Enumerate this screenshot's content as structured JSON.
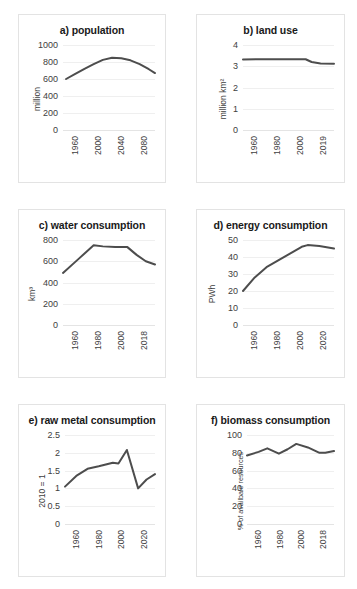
{
  "figure": {
    "background": "#ffffff",
    "line_color": "#4d4d4d",
    "grid_color": "#efefef",
    "panel_border_color": "#e3e3e3"
  },
  "chart_data": [
    {
      "type": "line",
      "title": "a) population",
      "xlabel": "",
      "ylabel": "million",
      "ylim": [
        0,
        1000
      ],
      "yticks": [
        "0",
        "200",
        "400",
        "600",
        "800",
        "1000"
      ],
      "xticks": [
        "1960",
        "2000",
        "2040",
        "2080"
      ],
      "xlim": [
        1950,
        2100
      ],
      "grid": true,
      "legend": "none",
      "x": [
        1955,
        1970,
        1985,
        2000,
        2015,
        2030,
        2045,
        2060,
        2075,
        2090,
        2100
      ],
      "values": [
        600,
        660,
        720,
        775,
        825,
        850,
        845,
        820,
        775,
        715,
        670
      ]
    },
    {
      "type": "line",
      "title": "b) land use",
      "xlabel": "",
      "ylabel": "million km²",
      "ylim": [
        0,
        4
      ],
      "yticks": [
        "0",
        "1",
        "2",
        "3",
        "4"
      ],
      "xticks": [
        "1960",
        "1980",
        "2000",
        "2019"
      ],
      "xlim": [
        1958,
        2019
      ],
      "grid": true,
      "legend": "none",
      "x": [
        1958,
        1970,
        1980,
        1990,
        2000,
        2004,
        2010,
        2019
      ],
      "values": [
        3.32,
        3.33,
        3.33,
        3.33,
        3.33,
        3.2,
        3.13,
        3.12
      ]
    },
    {
      "type": "line",
      "title": "c) water consumption",
      "xlabel": "",
      "ylabel": "km³",
      "ylim": [
        0,
        800
      ],
      "yticks": [
        "0",
        "200",
        "400",
        "600",
        "800"
      ],
      "xticks": [
        "1960",
        "1980",
        "2000",
        "2018"
      ],
      "xlim": [
        1958,
        2018
      ],
      "grid": true,
      "legend": "none",
      "x": [
        1958,
        1968,
        1978,
        1984,
        1992,
        2000,
        2006,
        2012,
        2018
      ],
      "values": [
        490,
        620,
        750,
        740,
        735,
        733,
        660,
        600,
        570
      ]
    },
    {
      "type": "line",
      "title": "d) energy consumption",
      "xlabel": "",
      "ylabel": "PWh",
      "ylim": [
        0,
        50
      ],
      "yticks": [
        "0",
        "10",
        "20",
        "30",
        "40",
        "50"
      ],
      "xticks": [
        "1960",
        "1980",
        "2000",
        "2020"
      ],
      "xlim": [
        1958,
        2020
      ],
      "grid": true,
      "legend": "none",
      "x": [
        1958,
        1966,
        1974,
        1982,
        1990,
        1998,
        2002,
        2010,
        2020
      ],
      "values": [
        20,
        28,
        34,
        38,
        42,
        46,
        47,
        46.5,
        45
      ]
    },
    {
      "type": "line",
      "title": "e) raw metal consumption",
      "xlabel": "",
      "ylabel": "2010 = 1",
      "ylim": [
        0,
        2.5
      ],
      "yticks": [
        "0",
        "0.5",
        "1",
        "1.5",
        "2",
        "2.5"
      ],
      "xticks": [
        "1960",
        "1980",
        "2000",
        "2020"
      ],
      "xlim": [
        1958,
        2022
      ],
      "grid": true,
      "legend": "none",
      "x": [
        1958,
        1966,
        1974,
        1982,
        1992,
        1996,
        2002,
        2010,
        2016,
        2022
      ],
      "values": [
        1.05,
        1.35,
        1.55,
        1.62,
        1.72,
        1.7,
        2.08,
        1.0,
        1.25,
        1.4
      ]
    },
    {
      "type": "line",
      "title": "f) biomass consumption",
      "xlabel": "",
      "ylabel": "% of availbale resources",
      "ylim": [
        0,
        100
      ],
      "yticks": [
        "0",
        "20",
        "40",
        "60",
        "80",
        "100"
      ],
      "xticks": [
        "1960",
        "1980",
        "2000",
        "2018"
      ],
      "xlim": [
        1958,
        2018
      ],
      "grid": true,
      "legend": "none",
      "x": [
        1958,
        1966,
        1972,
        1980,
        1986,
        1992,
        2000,
        2008,
        2012,
        2018
      ],
      "values": [
        77,
        81,
        85,
        79,
        84,
        90,
        86,
        80,
        80,
        82
      ]
    }
  ]
}
